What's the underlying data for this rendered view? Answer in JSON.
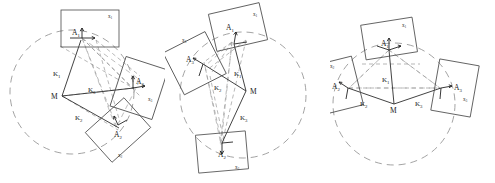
{
  "figure": {
    "title": "",
    "panel_count": 3,
    "width": 495,
    "height": 183,
    "background_color": "#ffffff",
    "stroke_color": "#3a3a3a",
    "dashed_color": "#8c8c8c"
  },
  "labels": {
    "center": "M",
    "a1": "A",
    "a2": "A",
    "a3": "A",
    "a1_sub": "1",
    "a2_sub": "2",
    "a3_sub": "3",
    "k1": "K",
    "k2": "K",
    "k3": "K",
    "k1_sub": "1",
    "k2_sub": "2",
    "k3_sub": "3",
    "x1": "x",
    "x2": "x",
    "x3": "x",
    "x1_sub": "1",
    "x2_sub": "2",
    "x3_sub": "3"
  },
  "panels": [
    {
      "id": "panel-a",
      "name": "left-panel",
      "origin_x": 0,
      "center": {
        "label": "M",
        "x": 62,
        "y": 96
      },
      "circle": {
        "cx": 72,
        "cy": 92,
        "r": 62
      },
      "frames": [
        {
          "id": "frame-1",
          "label": "A",
          "sub": "1",
          "corner_label": "x",
          "corner_sub": "1",
          "cx": 90,
          "cy": 28,
          "w": 58,
          "h": 37,
          "rotation": 0
        },
        {
          "id": "frame-2",
          "label": "A",
          "sub": "2",
          "corner_label": "x",
          "corner_sub": "2",
          "cx": 118,
          "cy": 130,
          "w": 52,
          "h": 40,
          "rotation": -42
        },
        {
          "id": "frame-3",
          "label": "A",
          "sub": "3",
          "corner_label": "x",
          "corner_sub": "3",
          "cx": 139,
          "cy": 88,
          "w": 44,
          "h": 52,
          "rotation": 18
        }
      ],
      "k_labels": [
        {
          "text": "K",
          "sub": "1",
          "x": 57,
          "y": 73
        },
        {
          "text": "K",
          "sub": "2",
          "x": 79,
          "y": 117
        },
        {
          "text": "K",
          "sub": "3",
          "x": 92,
          "y": 89
        }
      ]
    },
    {
      "id": "panel-b",
      "name": "middle-panel",
      "origin_x": 165,
      "center": {
        "label": "M",
        "x": 246,
        "y": 91
      },
      "circle": {
        "cx": 243,
        "cy": 95,
        "r": 63
      },
      "frames": [
        {
          "id": "frame-1",
          "label": "A",
          "sub": "1",
          "corner_label": "x",
          "corner_sub": "1",
          "cx": 238,
          "cy": 27,
          "w": 52,
          "h": 38,
          "rotation": -13
        },
        {
          "id": "frame-3",
          "label": "A",
          "sub": "3",
          "corner_label": "x",
          "corner_sub": "3",
          "cx": 194,
          "cy": 63,
          "w": 47,
          "h": 47,
          "rotation": -27
        },
        {
          "id": "frame-2",
          "label": "A",
          "sub": "2",
          "corner_label": "x",
          "corner_sub": "2",
          "cx": 222,
          "cy": 152,
          "w": 50,
          "h": 38,
          "rotation": -5
        }
      ],
      "k_labels": [
        {
          "text": "K",
          "sub": "1",
          "x": 237,
          "y": 73
        },
        {
          "text": "K",
          "sub": "2",
          "x": 218,
          "y": 87
        },
        {
          "text": "K",
          "sub": "3",
          "x": 243,
          "y": 117
        }
      ]
    },
    {
      "id": "panel-c",
      "name": "right-panel",
      "origin_x": 330,
      "center": {
        "label": "M",
        "x": 394,
        "y": 104
      },
      "circle": {
        "cx": 394,
        "cy": 104,
        "r": 61
      },
      "frames": [
        {
          "id": "frame-1",
          "label": "A",
          "sub": "1",
          "corner_label": "x",
          "corner_sub": "1",
          "cx": 389,
          "cy": 38,
          "w": 52,
          "h": 35,
          "rotation": -9
        },
        {
          "id": "frame-2",
          "label": "A",
          "sub": "2",
          "corner_label": "x",
          "corner_sub": "2",
          "cx": 339,
          "cy": 85,
          "w": 38,
          "h": 50,
          "rotation": -14
        },
        {
          "id": "frame-3",
          "label": "A",
          "sub": "3",
          "corner_label": "x",
          "corner_sub": "3",
          "cx": 455,
          "cy": 88,
          "w": 40,
          "h": 52,
          "rotation": 10
        }
      ],
      "k_labels": [
        {
          "text": "K",
          "sub": "1",
          "x": 386,
          "y": 79
        },
        {
          "text": "K",
          "sub": "2",
          "x": 364,
          "y": 102
        },
        {
          "text": "K",
          "sub": "3",
          "x": 419,
          "y": 102
        }
      ]
    }
  ]
}
